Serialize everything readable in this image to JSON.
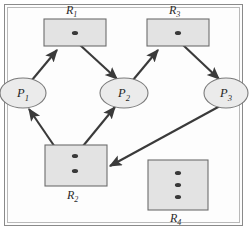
{
  "figure": {
    "kind": "resource-allocation-graph",
    "background_color": "#ffffff",
    "frame_color": "#8a8a8a",
    "edge_color": "#3a3a3a",
    "resource_fill": "#e3e3e3",
    "process_fill": "#ebebeb"
  },
  "resources": [
    {
      "id": "R1",
      "label": "R",
      "subscript": "1",
      "instances": 1,
      "label_position": "above",
      "box": {
        "x": 44,
        "y": 19,
        "w": 62,
        "h": 27
      },
      "dots": [
        {
          "x": 75,
          "y": 33
        }
      ],
      "label_xy": {
        "x": 66,
        "y": 14
      }
    },
    {
      "id": "R2",
      "label": "R",
      "subscript": "2",
      "instances": 2,
      "label_position": "below",
      "box": {
        "x": 45,
        "y": 145,
        "w": 62,
        "h": 41
      },
      "dots": [
        {
          "x": 75,
          "y": 156
        },
        {
          "x": 75,
          "y": 171
        }
      ],
      "label_xy": {
        "x": 67,
        "y": 199
      }
    },
    {
      "id": "R3",
      "label": "R",
      "subscript": "3",
      "instances": 1,
      "label_position": "above",
      "box": {
        "x": 147,
        "y": 19,
        "w": 62,
        "h": 27
      },
      "dots": [
        {
          "x": 178,
          "y": 33
        }
      ],
      "label_xy": {
        "x": 169,
        "y": 14
      }
    },
    {
      "id": "R4",
      "label": "R",
      "subscript": "4",
      "instances": 3,
      "label_position": "below",
      "box": {
        "x": 148,
        "y": 160,
        "w": 60,
        "h": 50
      },
      "dots": [
        {
          "x": 178,
          "y": 173
        },
        {
          "x": 178,
          "y": 185
        },
        {
          "x": 178,
          "y": 197
        }
      ],
      "label_xy": {
        "x": 170,
        "y": 222
      }
    }
  ],
  "processes": [
    {
      "id": "P1",
      "label": "P",
      "subscript": "1",
      "cx": 23,
      "cy": 93,
      "rx": 23,
      "ry": 15
    },
    {
      "id": "P2",
      "label": "P",
      "subscript": "2",
      "cx": 124,
      "cy": 93,
      "rx": 24,
      "ry": 15
    },
    {
      "id": "P3",
      "label": "P",
      "subscript": "3",
      "cx": 226,
      "cy": 93,
      "rx": 22,
      "ry": 15
    }
  ],
  "edges": [
    {
      "id": "e1",
      "from": "P1",
      "to": "R1",
      "kind": "request",
      "x1": 32,
      "y1": 80,
      "x2": 57,
      "y2": 50
    },
    {
      "id": "e2",
      "from": "R1",
      "to": "P2",
      "kind": "assignment",
      "x1": 80,
      "y1": 45,
      "x2": 117,
      "y2": 79
    },
    {
      "id": "e3",
      "from": "P2",
      "to": "R3",
      "kind": "request",
      "x1": 133,
      "y1": 80,
      "x2": 158,
      "y2": 50
    },
    {
      "id": "e4",
      "from": "R3",
      "to": "P3",
      "kind": "assignment",
      "x1": 183,
      "y1": 45,
      "x2": 219,
      "y2": 79
    },
    {
      "id": "e5",
      "from": "R2",
      "to": "P1",
      "kind": "assignment",
      "x1": 72,
      "y1": 172,
      "x2": 29,
      "y2": 109
    },
    {
      "id": "e6",
      "from": "R2",
      "to": "P2",
      "kind": "assignment",
      "x1": 74,
      "y1": 157,
      "x2": 115,
      "y2": 107
    },
    {
      "id": "e7",
      "from": "P3",
      "to": "R2",
      "kind": "request",
      "x1": 220,
      "y1": 106,
      "x2": 110,
      "y2": 166
    }
  ]
}
